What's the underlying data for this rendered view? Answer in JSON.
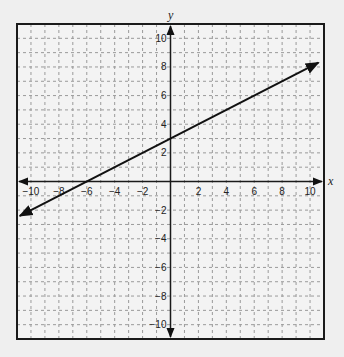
{
  "chart_data": {
    "type": "line",
    "title": "",
    "xlabel": "x",
    "ylabel": "y",
    "xlim": [
      -11,
      11
    ],
    "ylim": [
      -11,
      11
    ],
    "grid": true,
    "grid_style": "dashed",
    "x_ticks": [
      -10,
      -8,
      -6,
      -4,
      -2,
      2,
      4,
      6,
      8,
      10
    ],
    "y_ticks": [
      10,
      8,
      6,
      4,
      2,
      -2,
      -4,
      -6,
      -8,
      -10
    ],
    "x_tick_labels": [
      "−10",
      "−8",
      "−6",
      "−4",
      "−2",
      "2",
      "4",
      "6",
      "8",
      "10"
    ],
    "y_tick_labels": [
      "10",
      "8",
      "6",
      "4",
      "2",
      "−2",
      "−4",
      "−6",
      "−8",
      "−10"
    ],
    "series": [
      {
        "name": "line",
        "equation": "y = 0.5x + 3",
        "slope": 0.5,
        "y_intercept": 3,
        "x_intercept": -6,
        "points": [
          [
            -10.8,
            -2.4
          ],
          [
            -6,
            0
          ],
          [
            0,
            3
          ],
          [
            10.6,
            8.3
          ]
        ],
        "arrows": "both"
      }
    ],
    "legend": null
  },
  "colors": {
    "background": "#efefef",
    "plot_background": "#f3f3f3",
    "grid": "#9a9a9a",
    "axis": "#1a1a1a",
    "line": "#111111"
  }
}
